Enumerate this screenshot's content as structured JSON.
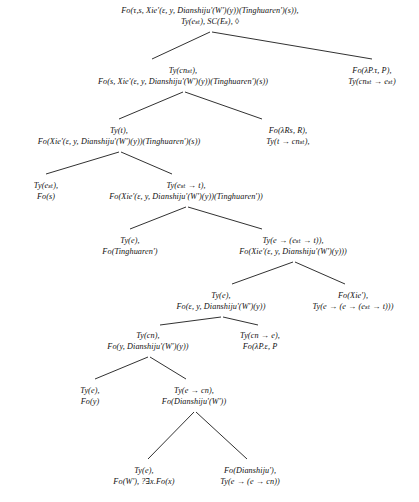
{
  "figure": {
    "kind": "semantic-derivation-tree",
    "notation": "DS-TTR / type-logical parse tree",
    "background_color": "#ffffff",
    "text_color": "#101010",
    "edge_color": "#1a1a1a"
  },
  "nodes": [
    {
      "id": "n0",
      "label": "root-node",
      "x": 210,
      "y": 6,
      "lines": [
        "Fo(τ,s, Xie'(ε, y, Dianshiju'(W')(y))(Tinghuaren')(s)),",
        "Ty(eₛₜ), SC(Eₛ), ◊"
      ]
    },
    {
      "id": "n1",
      "label": "level1-left-node",
      "x": 183,
      "y": 66,
      "lines": [
        "Ty(cnₛₜ),",
        "Fo(s, Xie'(ε, y, Dianshiju'(W')(y))(Tinghuaren')(s))"
      ]
    },
    {
      "id": "n2",
      "label": "level1-right-node",
      "x": 372,
      "y": 66,
      "lines": [
        "Fo(λP.τ, P),",
        "Ty(cnₛₜ → eₛₜ)"
      ]
    },
    {
      "id": "n3",
      "label": "level2-left-node",
      "x": 119,
      "y": 126,
      "lines": [
        "Ty(t),",
        "Fo(Xie'(ε, y, Dianshiju'(W')(y))(Tinghuaren')(s))"
      ]
    },
    {
      "id": "n4",
      "label": "level2-right-node",
      "x": 288,
      "y": 126,
      "lines": [
        "Fo(λRs, R),",
        "Ty(t → cnₛₜ),"
      ]
    },
    {
      "id": "n5",
      "label": "level3-left-node",
      "x": 46,
      "y": 181,
      "lines": [
        "Ty(eₛₜ),",
        "Fo(s)"
      ]
    },
    {
      "id": "n6",
      "label": "level3-right-node",
      "x": 186,
      "y": 181,
      "lines": [
        "Ty(eₛₜ → t),",
        "Fo(Xie'(ε, y, Dianshiju'(W')(y))(Tinghuaren'))"
      ]
    },
    {
      "id": "n7",
      "label": "level4-left-node",
      "x": 130,
      "y": 236,
      "lines": [
        "Ty(e),",
        "Fo(Tinghuaren')"
      ]
    },
    {
      "id": "n8",
      "label": "level4-right-node",
      "x": 293,
      "y": 236,
      "lines": [
        "Ty(e → (eₛₜ → t)),",
        "Fo(Xie'(ε, y, Dianshiju'(W')(y)))"
      ]
    },
    {
      "id": "n9",
      "label": "level5-left-node",
      "x": 221,
      "y": 291,
      "lines": [
        "Ty(e),",
        "Fo(ε, y, Dianshiju'(W')(y))"
      ]
    },
    {
      "id": "n10",
      "label": "level5-right-node",
      "x": 353,
      "y": 291,
      "lines": [
        "Fo(Xie'),",
        "Ty(e → (e → (eₛₜ → t)))"
      ]
    },
    {
      "id": "n11",
      "label": "level6-left-node",
      "x": 148,
      "y": 331,
      "lines": [
        "Ty(cn),",
        "Fo(y, Dianshiju'(W')(y))"
      ]
    },
    {
      "id": "n12",
      "label": "level6-right-node",
      "x": 260,
      "y": 331,
      "lines": [
        "Ty(cn → e),",
        "Fo(λP.ε, P"
      ]
    },
    {
      "id": "n13",
      "label": "level7-left-node",
      "x": 90,
      "y": 386,
      "lines": [
        "Ty(e),",
        "Fo(y)"
      ]
    },
    {
      "id": "n14",
      "label": "level7-right-node",
      "x": 194,
      "y": 386,
      "lines": [
        "Ty(e → cn),",
        "Fo(Dianshiju'(W'))"
      ]
    },
    {
      "id": "n15",
      "label": "level8-left-node",
      "x": 144,
      "y": 466,
      "lines": [
        "Ty(e),",
        "Fo(W'), ?∃x.Fo(x)"
      ]
    },
    {
      "id": "n16",
      "label": "level8-right-node",
      "x": 250,
      "y": 466,
      "lines": [
        "Fo(Dianshiju'),",
        "Ty(e → (e → cn))"
      ]
    }
  ],
  "edges": [
    {
      "id": "e0",
      "label": "edge-root-to-left",
      "x1": 210,
      "y1": 32,
      "x2": 152,
      "y2": 59
    },
    {
      "id": "e1",
      "label": "edge-root-to-right",
      "x1": 212,
      "y1": 32,
      "x2": 372,
      "y2": 59
    },
    {
      "id": "e2",
      "label": "edge-l1-to-left",
      "x1": 183,
      "y1": 92,
      "x2": 119,
      "y2": 119
    },
    {
      "id": "e3",
      "label": "edge-l1-to-right",
      "x1": 185,
      "y1": 92,
      "x2": 262,
      "y2": 119
    },
    {
      "id": "e4",
      "label": "edge-l2-to-left",
      "x1": 119,
      "y1": 152,
      "x2": 46,
      "y2": 174
    },
    {
      "id": "e5",
      "label": "edge-l2-to-right",
      "x1": 121,
      "y1": 152,
      "x2": 172,
      "y2": 174
    },
    {
      "id": "e6",
      "label": "edge-l3-to-left",
      "x1": 186,
      "y1": 207,
      "x2": 130,
      "y2": 229
    },
    {
      "id": "e7",
      "label": "edge-l3-to-right",
      "x1": 188,
      "y1": 207,
      "x2": 262,
      "y2": 229
    },
    {
      "id": "e8",
      "label": "edge-l4-to-left",
      "x1": 293,
      "y1": 262,
      "x2": 232,
      "y2": 284
    },
    {
      "id": "e9",
      "label": "edge-l4-to-right",
      "x1": 295,
      "y1": 262,
      "x2": 345,
      "y2": 284
    },
    {
      "id": "e10",
      "label": "edge-l5-to-left",
      "x1": 221,
      "y1": 317,
      "x2": 160,
      "y2": 325
    },
    {
      "id": "e11",
      "label": "edge-l5-to-right",
      "x1": 223,
      "y1": 317,
      "x2": 258,
      "y2": 325
    },
    {
      "id": "e12",
      "label": "edge-l6-to-left",
      "x1": 148,
      "y1": 357,
      "x2": 95,
      "y2": 379
    },
    {
      "id": "e13",
      "label": "edge-l6-to-right",
      "x1": 150,
      "y1": 357,
      "x2": 186,
      "y2": 379
    },
    {
      "id": "e14",
      "label": "edge-l7-to-left",
      "x1": 194,
      "y1": 412,
      "x2": 148,
      "y2": 459
    },
    {
      "id": "e15",
      "label": "edge-l7-to-right",
      "x1": 196,
      "y1": 412,
      "x2": 247,
      "y2": 459
    }
  ]
}
